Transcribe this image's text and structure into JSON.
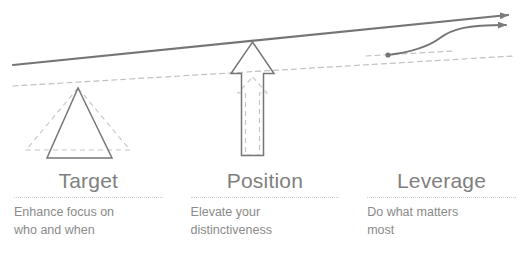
{
  "diagram": {
    "title_visible": false,
    "colors": {
      "solid_stroke": "#7b7b7b",
      "dashed_stroke": "#bdbdbd",
      "heading_text": "#7f7f7f",
      "body_text": "#8a8a8a",
      "divider": "#c9c9c9",
      "background": "#ffffff"
    },
    "shapes": {
      "beam_label": "rising-beam-line",
      "beam_dashed_label": "rising-beam-dashed-line",
      "triangle_label": "target-triangle",
      "triangle_dashed_label": "target-triangle-dashed",
      "arrow_label": "position-up-arrow",
      "arrow_dashed_label": "position-up-arrow-dashed",
      "curve_label": "leverage-s-curve",
      "curve_dashed_label": "leverage-baseline-dashed",
      "curve_origin_dot_label": "leverage-origin-dot"
    }
  },
  "columns": [
    {
      "heading": "Target",
      "description": "Enhance focus on\nwho and when",
      "icon": "triangle-icon"
    },
    {
      "heading": "Position",
      "description": "Elevate your\ndistinctiveness",
      "icon": "up-arrow-icon"
    },
    {
      "heading": "Leverage",
      "description": "Do what matters\nmost",
      "icon": "s-curve-icon"
    }
  ]
}
